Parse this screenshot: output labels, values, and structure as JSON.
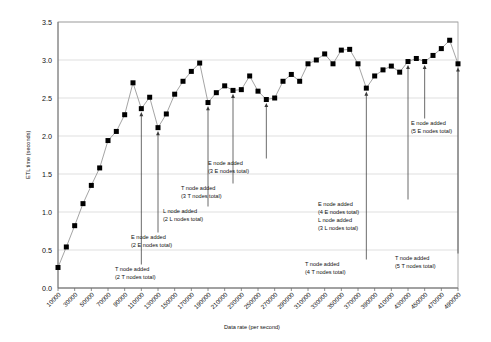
{
  "chart_data": {
    "type": "line",
    "title": "",
    "xlabel": "Data rate (per second)",
    "ylabel": "ETL time (seconds)",
    "ylim": [
      0.0,
      3.5
    ],
    "ytick_labels": [
      "0.0",
      "0.5",
      "1.0",
      "1.5",
      "2.0",
      "2.5",
      "3.0",
      "3.5"
    ],
    "ytick_values": [
      0.0,
      0.5,
      1.0,
      1.5,
      2.0,
      2.5,
      3.0,
      3.5
    ],
    "grid": true,
    "legend": "none",
    "marker": "filled-square",
    "categories": [
      "10000",
      "20000",
      "30000",
      "40000",
      "50000",
      "60000",
      "70000",
      "80000",
      "90000",
      "100000",
      "110000",
      "120000",
      "130000",
      "140000",
      "150000",
      "160000",
      "170000",
      "180000",
      "190000",
      "200000",
      "210000",
      "220000",
      "230000",
      "240000",
      "250000",
      "260000",
      "270000",
      "280000",
      "290000",
      "300000",
      "310000",
      "320000",
      "330000",
      "340000",
      "350000",
      "360000",
      "370000",
      "380000",
      "390000",
      "400000",
      "410000",
      "420000",
      "430000",
      "440000",
      "450000",
      "460000",
      "470000",
      "480000",
      "490000"
    ],
    "xtick_labels": [
      "10000",
      "30000",
      "50000",
      "70000",
      "90000",
      "110000",
      "130000",
      "150000",
      "170000",
      "190000",
      "210000",
      "230000",
      "250000",
      "270000",
      "290000",
      "310000",
      "330000",
      "350000",
      "370000",
      "390000",
      "410000",
      "430000",
      "450000",
      "470000",
      "490000"
    ],
    "values": [
      0.27,
      0.54,
      0.82,
      1.11,
      1.35,
      1.58,
      1.94,
      2.06,
      2.28,
      2.7,
      2.36,
      2.51,
      2.11,
      2.29,
      2.55,
      2.72,
      2.85,
      2.96,
      2.44,
      2.57,
      2.66,
      2.6,
      2.61,
      2.79,
      2.59,
      2.48,
      2.5,
      2.72,
      2.81,
      2.72,
      2.95,
      3.0,
      3.08,
      2.95,
      3.13,
      3.14,
      2.95,
      2.63,
      2.79,
      2.87,
      2.92,
      2.84,
      2.98,
      3.02,
      2.98,
      3.06,
      3.15,
      3.26,
      2.95
    ],
    "annotations": [
      {
        "id": "t-node-2",
        "lines": [
          "T node added",
          "(2 T nodes total)"
        ],
        "point_index": 10,
        "point_value": 2.36
      },
      {
        "id": "e-node-2",
        "lines": [
          "E node added",
          "(2 E nodes total)"
        ],
        "point_index": 12,
        "point_value": 2.11
      },
      {
        "id": "l-node-2",
        "lines": [
          "L node added",
          "(2 L nodes total)"
        ],
        "point_index": 18,
        "point_value": 2.44
      },
      {
        "id": "t-node-3",
        "lines": [
          "T node added",
          "(3 T nodes total)"
        ],
        "point_index": 21,
        "point_value": 2.6
      },
      {
        "id": "e-node-3",
        "lines": [
          "E node added",
          "(3 E nodes total)"
        ],
        "point_index": 25,
        "point_value": 2.48
      },
      {
        "id": "t-node-4",
        "lines": [
          "T node added",
          "(4 T nodes total)"
        ],
        "point_index": 37,
        "point_value": 2.63
      },
      {
        "id": "e-node-4-l-node-3",
        "lines": [
          "E node added",
          "(4 E nodes total)",
          "L node added",
          "(3 L nodes total)"
        ],
        "point_index": 42,
        "point_value": 2.98
      },
      {
        "id": "e-node-5",
        "lines": [
          "E node added",
          "(5 E nodes total)"
        ],
        "point_index": 44,
        "point_value": 2.98
      },
      {
        "id": "t-node-5",
        "lines": [
          "T node added",
          "(5 T nodes total)"
        ],
        "point_index": 48,
        "point_value": 2.95
      }
    ]
  },
  "colors": {
    "marker": "#000000",
    "line": "#8d8d8d",
    "grid": "#c9c9c9",
    "border": "#9a9a9a",
    "text": "#111111",
    "background": "#ffffff"
  }
}
